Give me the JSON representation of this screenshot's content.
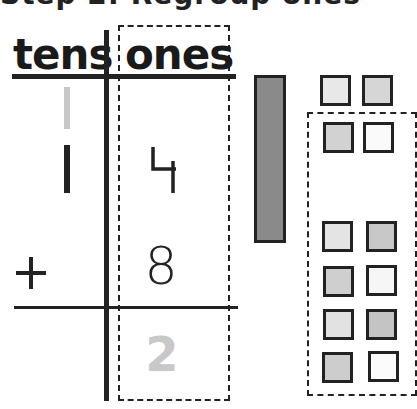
{
  "title": "Step 2: Regroup ones",
  "place_value_chart": {
    "headers": {
      "tens": "tens",
      "ones": "ones"
    },
    "carry_digit": "1",
    "rows": [
      {
        "operator": "",
        "tens": "1",
        "ones": "4"
      },
      {
        "operator": "+",
        "tens": "",
        "ones": "8"
      }
    ],
    "result": {
      "tens": "",
      "ones": "2"
    }
  },
  "blocks": {
    "rods": [
      {
        "label": "ten-rod",
        "color": "#8a8a8a"
      }
    ],
    "carried_units": [
      {
        "color": "#e8e8e8"
      },
      {
        "color": "#d6d6d6"
      }
    ],
    "regroup_units": [
      {
        "color": "#d2d2d2"
      },
      {
        "color": "#fafafa"
      },
      {
        "color": "#e4e4e4"
      },
      {
        "color": "#c8c8c8"
      },
      {
        "color": "#cfcfcf"
      },
      {
        "color": "#f6f6f6"
      },
      {
        "color": "#e2e2e2"
      },
      {
        "color": "#c4c4c4"
      },
      {
        "color": "#cdcdcd"
      },
      {
        "color": "#fbfbfb"
      }
    ]
  },
  "colors": {
    "ink": "#222222",
    "faded_digit": "#c8c8c8",
    "rod_fill": "#8a8a8a"
  }
}
